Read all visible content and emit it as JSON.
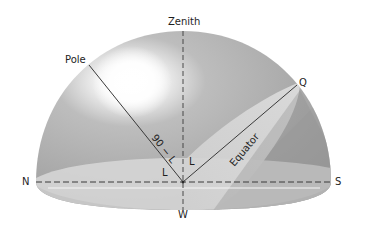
{
  "figure": {
    "type": "celestial-hemisphere-diagram",
    "labels": {
      "zenith": "Zenith",
      "pole": "Pole",
      "q": "Q",
      "north": "N",
      "south": "S",
      "west": "W",
      "equator": "Equator",
      "colatitude": "90 − L",
      "latitude_left": "L",
      "latitude_right": "L"
    },
    "colors": {
      "background": "#ffffff",
      "dome_shade": "#a9a9a9",
      "dome_light": "#d9d9d9",
      "highlight": "#ffffff",
      "horizon_plane": "#d4d4d4",
      "equator_band": "#c9c9c9",
      "line": "#3a3a3a",
      "text": "#1e1e1e"
    }
  }
}
